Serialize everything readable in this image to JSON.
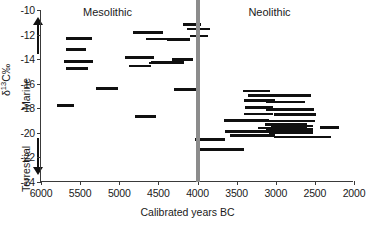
{
  "chart_data": {
    "type": "range-bar",
    "title": "",
    "xlabel": "Calibrated years BC",
    "ylabel": "δ¹13C‰",
    "ylabel_parts": {
      "delta": "δ",
      "sup": "13",
      "c": "C‰"
    },
    "xlim": [
      6000,
      2000
    ],
    "ylim": [
      -24,
      -10
    ],
    "x_inverted": true,
    "grid": false,
    "legend": null,
    "xticks": [
      6000,
      5500,
      5000,
      4500,
      4000,
      3500,
      3000,
      2500,
      2000
    ],
    "xtick_labels": [
      "6000",
      "5500",
      "5000",
      "4500",
      "4000",
      "3500",
      "3000",
      "2500",
      "2000"
    ],
    "yticks": [
      -10,
      -12,
      -14,
      -16,
      -18,
      -20,
      -22,
      -24
    ],
    "ytick_labels": [
      "-10",
      "-12",
      "-14",
      "-16",
      "-18",
      "-20",
      "-22",
      "-24"
    ],
    "annotations": [
      {
        "name": "period-label-mesolithic",
        "text": "Mesolithic",
        "x": 5150,
        "y": -10.35
      },
      {
        "name": "period-label-neolithic",
        "text": "Neolithic",
        "x": 3080,
        "y": -10.35
      },
      {
        "name": "diet-axis-marine",
        "text": "Marine"
      },
      {
        "name": "diet-axis-terrestrial",
        "text": "Terrestrial"
      }
    ],
    "markers": [
      {
        "name": "mesolithic-neolithic-boundary",
        "x": 4000,
        "color": "#8c8c8c",
        "width_px": 4
      }
    ],
    "series_name": "Calibrated date ranges of individual samples",
    "bar_color": "#101010",
    "ranges": [
      {
        "x_start": 5680,
        "x_end": 5350,
        "y": -12.3
      },
      {
        "x_start": 5680,
        "x_end": 5430,
        "y": -13.2
      },
      {
        "x_start": 5700,
        "x_end": 5340,
        "y": -14.2
      },
      {
        "x_start": 5680,
        "x_end": 5400,
        "y": -14.75
      },
      {
        "x_start": 5790,
        "x_end": 5580,
        "y": -17.75
      },
      {
        "x_start": 5300,
        "x_end": 5010,
        "y": -16.4
      },
      {
        "x_start": 4820,
        "x_end": 4440,
        "y": -11.85
      },
      {
        "x_start": 4930,
        "x_end": 4560,
        "y": -13.85
      },
      {
        "x_start": 4880,
        "x_end": 4600,
        "y": -14.55
      },
      {
        "x_start": 4660,
        "x_end": 4330,
        "y": -12.35
      },
      {
        "x_start": 4620,
        "x_end": 4340,
        "y": -14.3
      },
      {
        "x_start": 4600,
        "x_end": 4170,
        "y": -14.25
      },
      {
        "x_start": 4390,
        "x_end": 4090,
        "y": -12.4
      },
      {
        "x_start": 4330,
        "x_end": 4060,
        "y": -14.05
      },
      {
        "x_start": 4180,
        "x_end": 3950,
        "y": -11.2
      },
      {
        "x_start": 4130,
        "x_end": 3840,
        "y": -11.55
      },
      {
        "x_start": 4090,
        "x_end": 3870,
        "y": -12.1
      },
      {
        "x_start": 4300,
        "x_end": 4020,
        "y": -16.45
      },
      {
        "x_start": 4800,
        "x_end": 4530,
        "y": -18.65
      },
      {
        "x_start": 3420,
        "x_end": 3070,
        "y": -16.6
      },
      {
        "x_start": 3350,
        "x_end": 2550,
        "y": -16.95
      },
      {
        "x_start": 3400,
        "x_end": 3010,
        "y": -17.35
      },
      {
        "x_start": 3120,
        "x_end": 2620,
        "y": -17.5
      },
      {
        "x_start": 3390,
        "x_end": 3040,
        "y": -17.95
      },
      {
        "x_start": 3130,
        "x_end": 2510,
        "y": -18.1
      },
      {
        "x_start": 3400,
        "x_end": 3040,
        "y": -18.45
      },
      {
        "x_start": 3020,
        "x_end": 2480,
        "y": -18.5
      },
      {
        "x_start": 3660,
        "x_end": 3090,
        "y": -19.0
      },
      {
        "x_start": 3180,
        "x_end": 2500,
        "y": -19.05
      },
      {
        "x_start": 3140,
        "x_end": 2600,
        "y": -19.3
      },
      {
        "x_start": 3060,
        "x_end": 2530,
        "y": -19.45
      },
      {
        "x_start": 3230,
        "x_end": 2600,
        "y": -19.6
      },
      {
        "x_start": 3130,
        "x_end": 2520,
        "y": -19.75
      },
      {
        "x_start": 3650,
        "x_end": 3060,
        "y": -19.9
      },
      {
        "x_start": 3090,
        "x_end": 2520,
        "y": -19.95
      },
      {
        "x_start": 2440,
        "x_end": 2190,
        "y": -19.55
      },
      {
        "x_start": 3580,
        "x_end": 3010,
        "y": -20.2
      },
      {
        "x_start": 3020,
        "x_end": 2300,
        "y": -20.35
      },
      {
        "x_start": 4030,
        "x_end": 3650,
        "y": -20.55
      },
      {
        "x_start": 4020,
        "x_end": 3400,
        "y": -21.35
      }
    ]
  }
}
